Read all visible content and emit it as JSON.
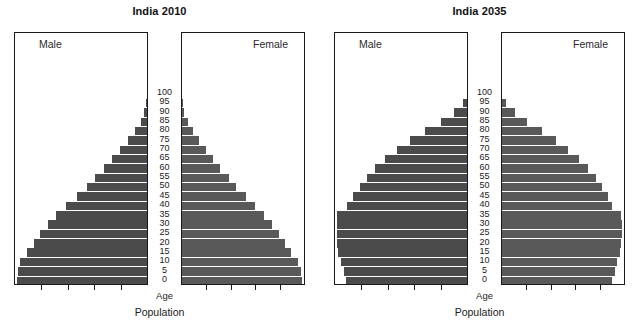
{
  "figure": {
    "xlabel": "Population",
    "age_caption": "Age",
    "male_label": "Male",
    "female_label": "Female",
    "bar_color_male": "#4b4b4b",
    "bar_color_female": "#595959",
    "frame_color": "#1a1a1a",
    "background": "#ffffff"
  },
  "panels": [
    {
      "title": "India 2010"
    },
    {
      "title": "India 2035"
    }
  ],
  "chart_data": [
    {
      "type": "bar",
      "title": "India 2010",
      "subtitle": "",
      "xlabel": "Population",
      "ylabel": "Age",
      "orientation": "horizontal",
      "style": "population-pyramid",
      "grid": false,
      "legend": [
        "Male",
        "Female"
      ],
      "legend_position": "inside-top-corners",
      "categories": [
        "0",
        "5",
        "10",
        "15",
        "20",
        "25",
        "30",
        "35",
        "40",
        "45",
        "50",
        "55",
        "60",
        "65",
        "70",
        "75",
        "80",
        "85",
        "90",
        "95",
        "100"
      ],
      "axis_ticks_count_per_side": 4,
      "series": [
        {
          "name": "Male",
          "side": "left",
          "values": [
            100,
            99,
            98,
            92,
            87,
            82,
            76,
            70,
            62,
            54,
            46,
            40,
            33,
            27,
            21,
            15,
            9,
            5,
            2,
            1,
            0
          ]
        },
        {
          "name": "Female",
          "side": "right",
          "values": [
            100,
            99,
            97,
            91,
            86,
            81,
            75,
            68,
            61,
            53,
            45,
            39,
            32,
            26,
            20,
            14,
            9,
            5,
            2,
            1,
            0
          ]
        }
      ],
      "value_units": "relative (percent of widest cohort)"
    },
    {
      "type": "bar",
      "title": "India 2035",
      "subtitle": "",
      "xlabel": "Population",
      "ylabel": "Age",
      "orientation": "horizontal",
      "style": "population-pyramid",
      "grid": false,
      "legend": [
        "Male",
        "Female"
      ],
      "legend_position": "inside-top-corners",
      "categories": [
        "0",
        "5",
        "10",
        "15",
        "20",
        "25",
        "30",
        "35",
        "40",
        "45",
        "50",
        "55",
        "60",
        "65",
        "70",
        "75",
        "80",
        "85",
        "90",
        "95",
        "100"
      ],
      "axis_ticks_count_per_side": 4,
      "series": [
        {
          "name": "Male",
          "side": "left",
          "values": [
            93,
            95,
            97,
            99,
            100,
            100,
            100,
            100,
            92,
            88,
            82,
            77,
            71,
            63,
            54,
            44,
            32,
            20,
            10,
            3,
            0
          ]
        },
        {
          "name": "Female",
          "side": "right",
          "values": [
            92,
            94,
            96,
            98,
            99,
            100,
            100,
            99,
            92,
            88,
            83,
            78,
            72,
            64,
            55,
            45,
            33,
            21,
            11,
            3,
            0
          ]
        }
      ],
      "value_units": "relative (percent of widest cohort)"
    }
  ]
}
